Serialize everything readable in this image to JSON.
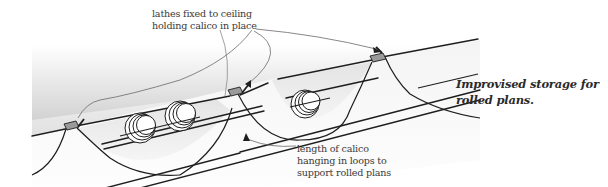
{
  "diagram": {
    "title": "Improvised storage for rolled plans",
    "caption": {
      "line1": "Improvised storage for",
      "line2": "rolled plans."
    },
    "labels": {
      "lathes": {
        "line1": "lathes fixed to ceiling",
        "line2": "holding calico in place"
      },
      "calico": {
        "line1": "length of calico",
        "line2": "hanging in loops to",
        "line3": "support rolled plans"
      }
    },
    "components": [
      {
        "name": "ceiling-lathe",
        "count": 3
      },
      {
        "name": "calico-loop",
        "count": 2
      },
      {
        "name": "rolled-plan",
        "count": 3
      }
    ],
    "colors": {
      "line": "#1e1e1e",
      "leader": "#6a6a6a",
      "lathe_fill": "#9a9a9a",
      "ceiling_shade": "#d8d8d8",
      "background": "#ffffff"
    }
  }
}
